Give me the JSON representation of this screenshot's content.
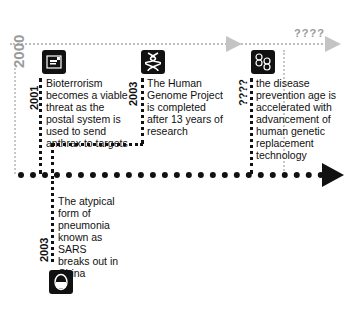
{
  "top_track": {
    "start_year": "2000",
    "end_label": "????",
    "color": "#bdbdbd"
  },
  "main_track": {
    "color": "#111111"
  },
  "events": [
    {
      "year": "2001",
      "text_lines": [
        "Bioterrorism",
        "becomes a viable",
        "threat as the",
        "postal system is",
        "used to send",
        "anthrax to targets"
      ],
      "icon": "mail-envelope-icon"
    },
    {
      "year": "2003",
      "text_lines": [
        "The Human",
        "Genome Project",
        "is completed",
        "after 13 years of",
        "research"
      ],
      "icon": "dna-helix-icon"
    },
    {
      "year": "????",
      "text_lines": [
        "the disease",
        "prevention age is",
        "accelerated with",
        "advancement of",
        "human genetic",
        "replacement",
        "technology"
      ],
      "icon": "double-dna-icon"
    },
    {
      "year": "2003",
      "text_lines": [
        "The atypical",
        "form of",
        "pneumonia",
        "known as",
        "SARS",
        "breaks out in",
        "China"
      ],
      "icon": "face-mask-icon"
    }
  ]
}
